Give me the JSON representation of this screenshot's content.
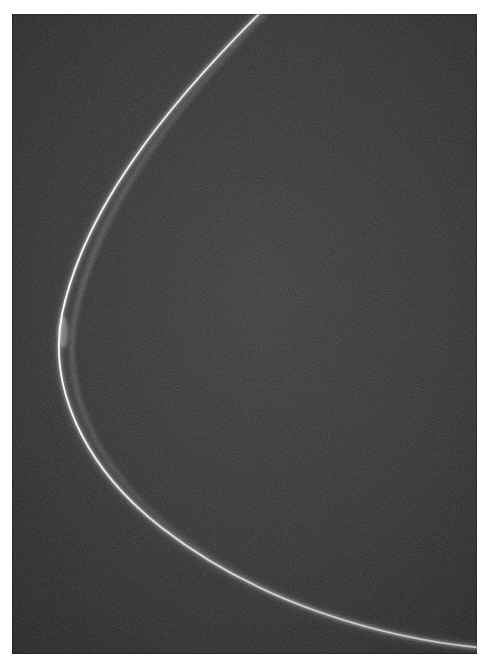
{
  "page": {
    "width": 489,
    "height": 670,
    "background_color": "#ffffff",
    "caption": ""
  },
  "plate": {
    "name": "grayscale-photographic-plate",
    "left": 12,
    "top": 14,
    "width": 465,
    "height": 640,
    "background_color": "#2d2d2d",
    "film_grain": "fine-monochrome-noise",
    "media": "monochrome-photograph"
  },
  "chart_data": {
    "type": "line",
    "title": "",
    "subtitle": "",
    "xlabel": "",
    "ylabel": "",
    "grid": false,
    "legend": null,
    "axis_visible": false,
    "tick_labels_x": [],
    "tick_labels_y": [],
    "xlim": [
      0,
      465
    ],
    "ylim": [
      0,
      640
    ],
    "series": [
      {
        "name": "bright-parabolic-arc-core",
        "stroke_color": "#f2f2ee",
        "stroke_width": 2.1,
        "x": [
          253,
          230,
          206,
          182,
          158,
          135,
          113,
          95,
          79,
          66,
          56,
          50,
          49,
          52,
          60,
          72,
          88,
          107,
          129,
          154,
          181,
          210,
          241,
          273,
          307,
          342,
          378,
          415,
          453,
          465
        ],
        "y": [
          0,
          14,
          30,
          48,
          68,
          91,
          117,
          145,
          175,
          207,
          241,
          277,
          300,
          320,
          348,
          381,
          412,
          441,
          469,
          495,
          519,
          541,
          561,
          579,
          595,
          608,
          618,
          625,
          630,
          631
        ]
      },
      {
        "name": "inner-halo-band",
        "stroke_color": "#8d8d88",
        "stroke_width": 3.4,
        "offset": "inside-of-core",
        "x": [
          259,
          236,
          212,
          189,
          166,
          144,
          123,
          105,
          90,
          78,
          69,
          64,
          63,
          66,
          74,
          87,
          104,
          124,
          146,
          171,
          198,
          227,
          258,
          290,
          323,
          357,
          392,
          428,
          462,
          465
        ],
        "y": [
          0,
          16,
          33,
          52,
          72,
          95,
          121,
          149,
          179,
          211,
          245,
          281,
          304,
          325,
          353,
          386,
          417,
          446,
          473,
          499,
          523,
          544,
          563,
          581,
          597,
          609,
          619,
          626,
          631,
          632
        ]
      }
    ],
    "annotations": [
      {
        "name": "vertex",
        "label": "",
        "x": 49,
        "y": 303,
        "note": "leftmost turning point of the arc"
      },
      {
        "name": "top-edge-crossing",
        "label": "",
        "x": 253,
        "y": 0
      },
      {
        "name": "right-edge-crossing",
        "label": "",
        "x": 465,
        "y": 631
      }
    ]
  },
  "colors": {
    "paper": "#ffffff",
    "plate_base": "#2d2d2d",
    "plate_dark": "#232323",
    "plate_light": "#3a3a3a",
    "curve_core": "#f2f2ee",
    "curve_glow": "#9a9a94",
    "curve_halo": "#55554f"
  }
}
